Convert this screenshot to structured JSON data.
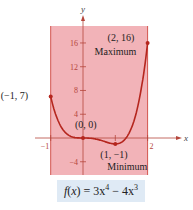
{
  "chart_data": {
    "type": "line",
    "title": "",
    "function_label": "f(x) = 3x⁴ − 4x³",
    "formula": {
      "f": "f",
      "x": "x",
      "rhs1": "3x",
      "e1": "4",
      "minus": " − ",
      "rhs2": "4x",
      "e2": "3"
    },
    "xlabel": "x",
    "ylabel": "y",
    "xlim": [
      -1.5,
      2.6
    ],
    "ylim": [
      -6,
      20
    ],
    "shaded_interval": [
      -1,
      2
    ],
    "x_ticks": [
      {
        "v": -1,
        "label": "−1"
      },
      {
        "v": 1,
        "label": ""
      },
      {
        "v": 2,
        "label": "2"
      }
    ],
    "y_ticks": [
      {
        "v": -4,
        "label": "−4"
      },
      {
        "v": 4,
        "label": "4"
      },
      {
        "v": 8,
        "label": "8"
      },
      {
        "v": 12,
        "label": "12"
      },
      {
        "v": 16,
        "label": "16"
      }
    ],
    "points": [
      {
        "x": -1,
        "y": 7,
        "label": "(−1, 7)",
        "note": ""
      },
      {
        "x": 0,
        "y": 0,
        "label": "(0, 0)",
        "note": ""
      },
      {
        "x": 1,
        "y": -1,
        "label": "(1, −1)",
        "note": "Minimum"
      },
      {
        "x": 2,
        "y": 16,
        "label": "(2, 16)",
        "note": "Maximum"
      }
    ],
    "colors": {
      "curve": "#b5261e",
      "shade": "#f2b3b8",
      "formula_bg": "#dfeaf5"
    }
  }
}
